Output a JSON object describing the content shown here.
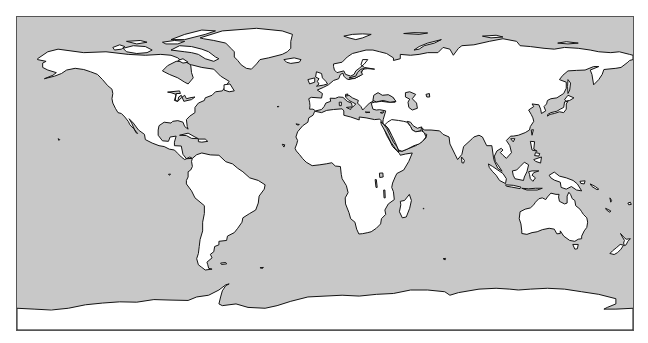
{
  "map": {
    "projection": "equirectangular",
    "extent": {
      "lon": [
        -180,
        180
      ],
      "lat": [
        -90,
        90
      ]
    },
    "colors": {
      "ocean": "#c8c8c8",
      "land": "#ffffff",
      "coast": "#111111",
      "frame": "#555555"
    },
    "features": {
      "continents": [
        "North America",
        "Greenland",
        "South America",
        "Europe",
        "Asia",
        "Africa",
        "Australia",
        "Antarctica"
      ],
      "islands": [
        "Canadian Arctic Archipelago",
        "Iceland",
        "Great Britain",
        "Madagascar",
        "Japan",
        "Borneo",
        "Sumatra",
        "New Guinea",
        "New Zealand",
        "Tasmania",
        "Sri Lanka",
        "Cuba",
        "Svalbard",
        "Novaya Zemlya"
      ],
      "water_bodies": [
        "Hudson Bay",
        "Great Lakes",
        "Gulf of Mexico",
        "Caribbean Sea",
        "Mediterranean Sea",
        "Black Sea",
        "Caspian Sea",
        "Red Sea",
        "Persian Gulf",
        "Baltic Sea",
        "Lake Victoria",
        "Lake Malawi"
      ]
    }
  }
}
